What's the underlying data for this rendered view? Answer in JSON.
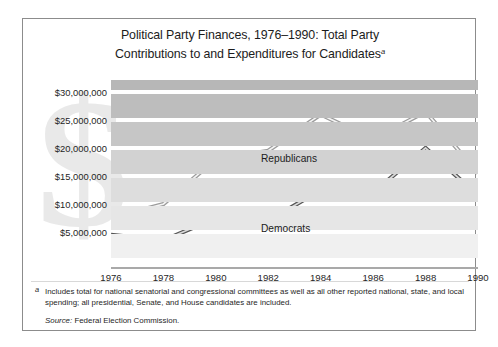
{
  "title": {
    "line1": "Political Party Finances, 1976–1990: Total Party",
    "line2": "Contributions to and Expenditures for Candidates",
    "footnote_marker": "a"
  },
  "axes": {
    "y_tick_labels": [
      "$30,000,000",
      "$25,000,000",
      "$20,000,000",
      "$15,000,000",
      "$10,000,000",
      "$5,000,000"
    ],
    "x_tick_labels": [
      "1976",
      "1978",
      "1980",
      "1982",
      "1984",
      "1986",
      "1988",
      "1990"
    ]
  },
  "series_labels": {
    "republicans": "Republicans",
    "democrats": "Democrats"
  },
  "watermark": {
    "glyph": "$"
  },
  "footnote": {
    "marker": "a",
    "text": "Includes total for national senatorial and congressional committees as well as all other reported national, state, and local spending; all presidential, Senate, and House candidates are included.",
    "source_label": "Source:",
    "source_value": "Federal Election Commission."
  },
  "colors": {
    "frame_border": "#8c8c8c",
    "republican_line": "#9a9a9a",
    "democrat_line": "#585858",
    "band_dark": "#b9b9b9",
    "band_light": "#ededed",
    "axis_line": "#a9a9a9",
    "watermark": "#e9e9e9"
  },
  "chart_data": {
    "type": "line",
    "title": "Political Party Finances, 1976–1990: Total Party Contributions to and Expenditures for Candidates",
    "xlabel": "",
    "ylabel": "",
    "x": [
      1976,
      1978,
      1980,
      1982,
      1984,
      1986,
      1988,
      1990
    ],
    "categories": [
      "1976",
      "1978",
      "1980",
      "1982",
      "1984",
      "1986",
      "1988",
      "1990"
    ],
    "ylim": [
      0,
      32500000
    ],
    "xlim": [
      1976,
      1990
    ],
    "ytick_values": [
      30000000,
      25000000,
      20000000,
      15000000,
      10000000,
      5000000
    ],
    "grid": "horizontal-bands",
    "legend_position": "inline-annotations",
    "series": [
      {
        "name": "Republicans",
        "values": [
          7500000,
          10000000,
          18000000,
          19500000,
          26000000,
          21500000,
          26500000,
          15500000
        ]
      },
      {
        "name": "Democrats",
        "values": [
          4500000,
          3500000,
          7500000,
          7000000,
          12500000,
          12000000,
          20000000,
          11500000
        ]
      }
    ]
  }
}
